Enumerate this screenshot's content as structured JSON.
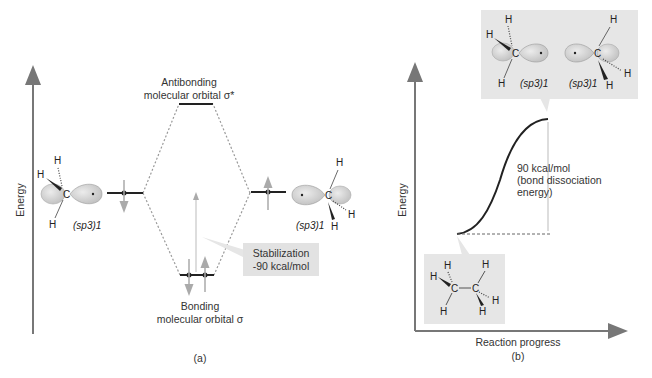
{
  "panel_a": {
    "caption": "(a)",
    "y_axis_label": "Energy",
    "antibonding_label_line1": "Antibonding",
    "antibonding_label_line2": "molecular orbital σ*",
    "bonding_label_line1": "Bonding",
    "bonding_label_line2": "molecular orbital σ",
    "left_orbital_label": "(sp3)1",
    "right_orbital_label": "(sp3)1",
    "stabilization_line1": "Stabilization",
    "stabilization_line2": "-90 kcal/mol",
    "atom_C": "C",
    "atom_H": "H"
  },
  "panel_b": {
    "caption": "(b)",
    "y_axis_label": "Energy",
    "x_axis_label": "Reaction progress",
    "energy_label_line1": "90 kcal/mol",
    "energy_label_line2": "(bond dissociation",
    "energy_label_line3": "energy)",
    "top_left_orbital_label": "(sp3)1",
    "top_right_orbital_label": "(sp3)1",
    "atom_C": "C",
    "atom_H": "H"
  },
  "colors": {
    "axis": "#777777",
    "box_fill": "#e6e6e6",
    "lobe_fill": "#d2d2d2",
    "lobe_stroke": "#9a9a9a",
    "line": "#222222",
    "arrow": "#999999"
  }
}
